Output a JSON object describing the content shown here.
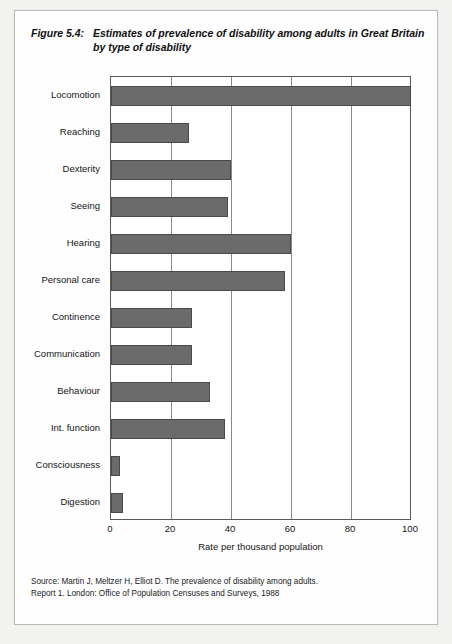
{
  "figure": {
    "number": "Figure 5.4:",
    "title": "Estimates of prevalence of disability among adults in Great Britain by type of disability"
  },
  "source": {
    "line1": "Source: Martin J, Meltzer H, Elliot D. The prevalence of disability among adults.",
    "line2": "Report 1. London: Office of Population Censuses and Surveys, 1988"
  },
  "colors": {
    "bar_fill": "#6b6b6b",
    "bar_edge": "#4a4a4a",
    "axis": "#5a5a5a",
    "gridline": "#8a8a8a",
    "page_background": "#f2f2f0",
    "plot_background": "#ffffff"
  },
  "chart_data": {
    "type": "bar",
    "orientation": "horizontal",
    "title": "Estimates of prevalence of disability among adults in Great Britain by type of disability",
    "xlabel": "Rate per thousand population",
    "ylabel": "",
    "categories": [
      "Locomotion",
      "Reaching",
      "Dexterity",
      "Seeing",
      "Hearing",
      "Personal care",
      "Continence",
      "Communication",
      "Behaviour",
      "Int. function",
      "Consciousness",
      "Digestion"
    ],
    "values": [
      100,
      26,
      40,
      39,
      60,
      58,
      27,
      27,
      33,
      38,
      3,
      4
    ],
    "xlim": [
      0,
      100
    ],
    "xticks": [
      0,
      20,
      40,
      60,
      80,
      100
    ],
    "xtick_labels": [
      "0",
      "20",
      "40",
      "60",
      "80",
      "100"
    ],
    "grid": true,
    "grid_axis": "x",
    "legend": false
  }
}
